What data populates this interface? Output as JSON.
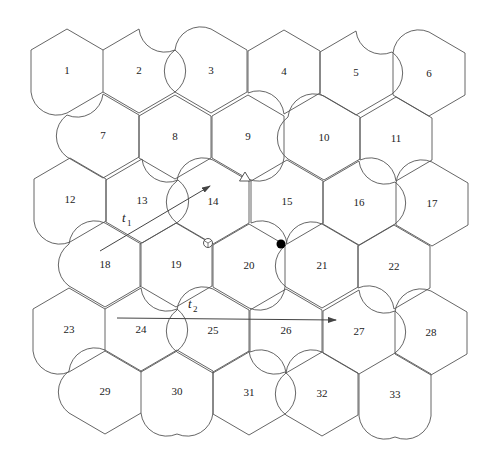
{
  "figure": {
    "type": "hexagonal-tiling-with-curved-edges",
    "tiles": [
      {
        "id": "1",
        "x": 67,
        "y": 71
      },
      {
        "id": "2",
        "x": 139,
        "y": 71
      },
      {
        "id": "3",
        "x": 211,
        "y": 71
      },
      {
        "id": "4",
        "x": 284,
        "y": 72
      },
      {
        "id": "5",
        "x": 356,
        "y": 73
      },
      {
        "id": "6",
        "x": 429,
        "y": 74
      },
      {
        "id": "7",
        "x": 103,
        "y": 136
      },
      {
        "id": "8",
        "x": 175,
        "y": 137
      },
      {
        "id": "9",
        "x": 248,
        "y": 137
      },
      {
        "id": "10",
        "x": 324,
        "y": 138
      },
      {
        "id": "11",
        "x": 396,
        "y": 139
      },
      {
        "id": "12",
        "x": 70,
        "y": 200
      },
      {
        "id": "13",
        "x": 142,
        "y": 201
      },
      {
        "id": "14",
        "x": 213,
        "y": 202
      },
      {
        "id": "15",
        "x": 287,
        "y": 202
      },
      {
        "id": "16",
        "x": 359,
        "y": 203
      },
      {
        "id": "17",
        "x": 432,
        "y": 204
      },
      {
        "id": "18",
        "x": 105,
        "y": 265
      },
      {
        "id": "19",
        "x": 176,
        "y": 265
      },
      {
        "id": "20",
        "x": 249,
        "y": 266
      },
      {
        "id": "21",
        "x": 322,
        "y": 266
      },
      {
        "id": "22",
        "x": 394,
        "y": 267
      },
      {
        "id": "23",
        "x": 69,
        "y": 330
      },
      {
        "id": "24",
        "x": 141,
        "y": 330
      },
      {
        "id": "25",
        "x": 213,
        "y": 331
      },
      {
        "id": "26",
        "x": 286,
        "y": 331
      },
      {
        "id": "27",
        "x": 359,
        "y": 332
      },
      {
        "id": "28",
        "x": 431,
        "y": 333
      },
      {
        "id": "29",
        "x": 105,
        "y": 392
      },
      {
        "id": "30",
        "x": 177,
        "y": 392
      },
      {
        "id": "31",
        "x": 249,
        "y": 393
      },
      {
        "id": "32",
        "x": 322,
        "y": 394
      },
      {
        "id": "33",
        "x": 395,
        "y": 395
      }
    ],
    "vectors": [
      {
        "name": "t",
        "subscript": "1",
        "label_x": 122,
        "label_y": 222,
        "from": [
          100,
          251
        ],
        "to": [
          210,
          186
        ]
      },
      {
        "name": "t",
        "subscript": "2",
        "label_x": 188,
        "label_y": 308,
        "from": [
          117,
          318
        ],
        "to": [
          336,
          320
        ]
      }
    ],
    "markers": [
      {
        "kind": "triangle-open",
        "x": 245,
        "y": 177
      },
      {
        "kind": "circle-open",
        "x": 208,
        "y": 243
      },
      {
        "kind": "circle-filled",
        "x": 281,
        "y": 244
      }
    ],
    "colors": {
      "line": "#555555",
      "text": "#222222",
      "background": "#ffffff"
    }
  }
}
